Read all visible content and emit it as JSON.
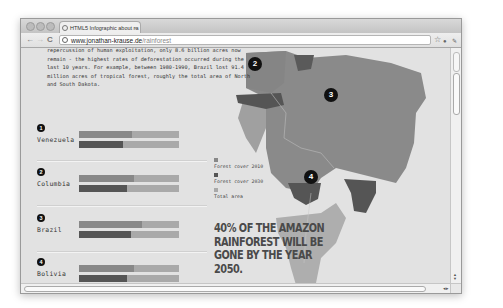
{
  "browser": {
    "tab_title": "HTML5 Infographic about ra",
    "tab_close": "×",
    "url_domain": "www.jonathan-krause.de",
    "url_path": "/rainforest",
    "nav": {
      "back": "←",
      "forward": "→",
      "reload": "C"
    },
    "toolbar_icons": {
      "star": "☆",
      "page": "●",
      "wrench": "🔧"
    }
  },
  "page": {
    "intro_text": "repercussion of human exploitation, only 8.6 billion acres now remain - the highest rates of deforestation occurred during the last 10 years. For example, between 1980-1990, Brazil lost 91.4 million acres of tropical forest, roughly the total area of North and South Dakota.",
    "countries": [
      {
        "number": "1",
        "name": "Venezuela",
        "forest_2010_pct": 53,
        "forest_2030_pct": 44
      },
      {
        "number": "2",
        "name": "Columbia",
        "forest_2010_pct": 55,
        "forest_2030_pct": 48
      },
      {
        "number": "3",
        "name": "Brazil",
        "forest_2010_pct": 63,
        "forest_2030_pct": 52
      },
      {
        "number": "4",
        "name": "Bolivia",
        "forest_2010_pct": 55,
        "forest_2030_pct": 48
      }
    ],
    "legend": [
      {
        "label": "Forest cover 2010",
        "color": "#888888"
      },
      {
        "label": "Forest cover 2030",
        "color": "#555555"
      },
      {
        "label": "Total area",
        "color": "#a9a9a9"
      }
    ],
    "headline": "40% OF THE AMAZON RAINFOREST WILL BE GONE BY THE YEAR 2050.",
    "map_markers": [
      {
        "number": "2"
      },
      {
        "number": "3"
      },
      {
        "number": "4"
      }
    ]
  },
  "colors": {
    "page_bg": "#e2e2e2",
    "forest_2010": "#888888",
    "forest_2030": "#555555",
    "total_area": "#a9a9a9",
    "map_amazon": "#8a8a8a",
    "map_dark": "#555555",
    "map_light": "#aeaeae"
  }
}
